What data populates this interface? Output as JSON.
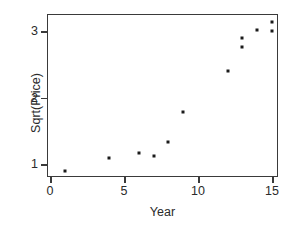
{
  "chart_data": {
    "type": "scatter",
    "title": "",
    "xlabel": "Year",
    "ylabel": "Sqrt(Price)",
    "xlim": [
      0,
      15.6
    ],
    "ylim": [
      0.82,
      3.22
    ],
    "xticks": [
      0,
      5,
      10,
      15
    ],
    "xtick_labels": [
      "0",
      "5",
      "10",
      "15"
    ],
    "yticks": [
      1,
      2,
      3
    ],
    "ytick_labels": [
      "1",
      "2",
      "3"
    ],
    "grid": false,
    "legend": null,
    "marker": "square",
    "marker_color": "#1b1b1b",
    "frame_color": "#3a3a3a",
    "background": "#ffffff",
    "x": [
      1,
      4,
      6,
      7,
      8,
      9,
      12,
      13,
      13,
      14,
      15,
      15
    ],
    "y": [
      0.9,
      1.09,
      1.17,
      1.12,
      1.33,
      1.78,
      2.4,
      2.76,
      2.9,
      3.02,
      3.0,
      3.13
    ],
    "points": [
      {
        "x": 1,
        "y": 0.9
      },
      {
        "x": 4,
        "y": 1.09
      },
      {
        "x": 6,
        "y": 1.17
      },
      {
        "x": 7,
        "y": 1.12
      },
      {
        "x": 8,
        "y": 1.33
      },
      {
        "x": 9,
        "y": 1.78
      },
      {
        "x": 12,
        "y": 2.4
      },
      {
        "x": 13,
        "y": 2.76
      },
      {
        "x": 13,
        "y": 2.9
      },
      {
        "x": 14,
        "y": 3.02
      },
      {
        "x": 15,
        "y": 3.0
      },
      {
        "x": 15,
        "y": 3.13
      }
    ]
  }
}
